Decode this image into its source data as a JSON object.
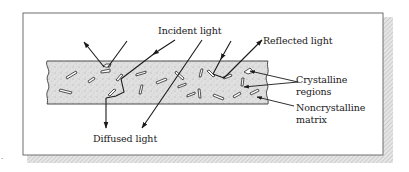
{
  "figure": {
    "type": "schematic cross-section of semicrystalline polymer light scattering",
    "marker": ".",
    "colors": {
      "frame": "#6f6f6f",
      "shadow": "#c9c9c9",
      "band_fill": "#dcdcdc",
      "band_stroke": "#4a4a4a",
      "ink": "#1a1a1a"
    }
  },
  "labels": {
    "incident": "Incident light",
    "reflected": "Reflected light",
    "crystalline_line1": "Crystalline",
    "crystalline_line2": "regions",
    "noncrystalline_line1": "Noncrystalline",
    "noncrystalline_line2": "matrix",
    "diffused": "Diffused light"
  }
}
